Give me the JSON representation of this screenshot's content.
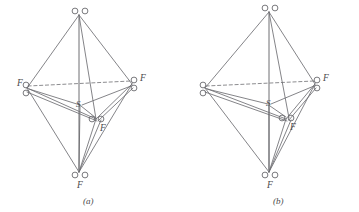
{
  "figure": {
    "background_color": "#ffffff",
    "line_color": "#6e6e72",
    "atom_stroke_color": "#6a6a6e",
    "text_color": "#4a4a4a",
    "panels": [
      {
        "id": "a",
        "caption": "(a)",
        "center_atom_label": "S",
        "atom_symbols": {
          "oxygen": "O",
          "fluorine": "F",
          "sulfur": "S"
        },
        "vertices": [
          {
            "name": "apex-top",
            "label": "",
            "atom_count": 2,
            "arrangement": "horizontal"
          },
          {
            "name": "equatorial-left",
            "label": "F",
            "label_side": "left",
            "atom_count": 2,
            "arrangement": "vertical"
          },
          {
            "name": "equatorial-right",
            "label": "F",
            "label_side": "right",
            "atom_count": 2,
            "arrangement": "vertical"
          },
          {
            "name": "equatorial-front",
            "label": "F",
            "label_side": "below-right",
            "atom_count": 2,
            "arrangement": "horizontal"
          },
          {
            "name": "apex-bottom",
            "label": "F",
            "label_side": "below",
            "atom_count": 2,
            "arrangement": "horizontal"
          }
        ]
      },
      {
        "id": "b",
        "caption": "(b)",
        "center_atom_label": "S",
        "atom_symbols": {
          "oxygen": "O",
          "fluorine": "F",
          "sulfur": "S"
        },
        "vertices": [
          {
            "name": "apex-top",
            "label": "",
            "atom_count": 2,
            "arrangement": "horizontal"
          },
          {
            "name": "equatorial-left",
            "label": "",
            "label_side": "none",
            "atom_count": 2,
            "arrangement": "vertical"
          },
          {
            "name": "equatorial-right",
            "label": "F",
            "label_side": "right",
            "atom_count": 2,
            "arrangement": "vertical"
          },
          {
            "name": "equatorial-front",
            "label": "F",
            "label_side": "below-right",
            "atom_count": 2,
            "arrangement": "horizontal"
          },
          {
            "name": "apex-bottom",
            "label": "F",
            "label_side": "below",
            "atom_count": 2,
            "arrangement": "horizontal"
          }
        ]
      }
    ]
  },
  "panel_a": {
    "caption": "(a)",
    "center_label": "S",
    "top_atom_1": "O",
    "top_atom_2": "O",
    "left_label": "F",
    "left_atom_1": "O",
    "left_atom_2": "O",
    "right_atom_1": "O",
    "right_atom_2": "O",
    "right_label": "F",
    "front_atom_1": "O",
    "front_atom_2": "O",
    "front_label": "F",
    "bottom_atom_1": "O",
    "bottom_atom_2": "O",
    "bottom_label": "F"
  },
  "panel_b": {
    "caption": "(b)",
    "center_label": "S",
    "top_atom_1": "O",
    "top_atom_2": "O",
    "left_atom_1": "O",
    "left_atom_2": "O",
    "right_atom_1": "O",
    "right_label": "F",
    "right_atom_2": "O",
    "front_atom_1": "O",
    "front_atom_2": "O",
    "front_label": "F",
    "bottom_atom_1": "O",
    "bottom_atom_2": "O",
    "bottom_label": "F"
  }
}
